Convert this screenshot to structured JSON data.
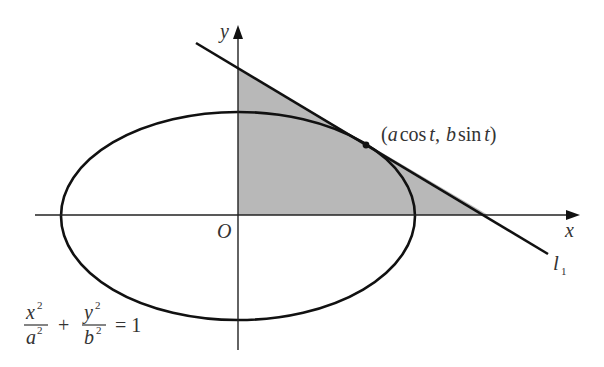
{
  "diagram": {
    "colors": {
      "stroke": "#111111",
      "shade": "#b8b8b8",
      "text": "#333333",
      "background": "#ffffff"
    },
    "axes": {
      "x_label": "x",
      "y_label": "y",
      "origin_label": "O"
    },
    "tangent_point": {
      "label": "(a cos t, b sin t)",
      "parts": {
        "open": "(",
        "a": "a",
        "cos": "cos",
        "t1": "t",
        "comma": ",",
        "b": "b",
        "sin": "sin",
        "t2": "t",
        "close": ")"
      }
    },
    "line": {
      "label": "l",
      "subscript": "1"
    },
    "equation": {
      "text": "x²/a² + y²/b² = 1",
      "frac1": {
        "num": "x",
        "num_exp": "2",
        "den": "a",
        "den_exp": "2"
      },
      "plus": "+",
      "frac2": {
        "num": "y",
        "num_exp": "2",
        "den": "b",
        "den_exp": "2"
      },
      "rhs": "= 1"
    }
  }
}
